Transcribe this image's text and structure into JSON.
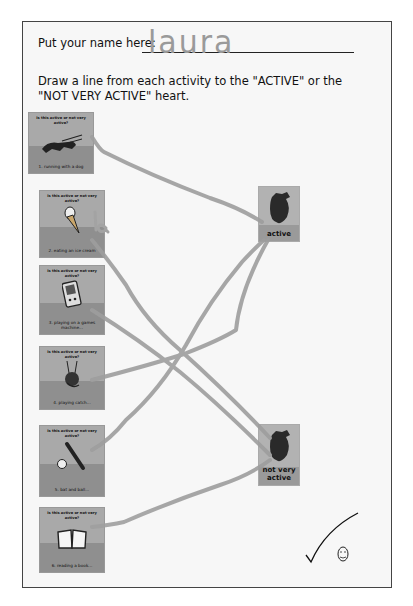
{
  "worksheet": {
    "name_prompt": "Put your name here:",
    "name_value": "laura",
    "instruction": "Draw a line from each activity to the \"ACTIVE\" or the \"NOT VERY ACTIVE\" heart."
  },
  "activities": [
    {
      "question": "Is this active or not very active?",
      "caption": "1. running with a dog",
      "icon": "dog-running-icon",
      "answer": "active"
    },
    {
      "question": "Is this active or not very active?",
      "caption": "2. eating an ice cream",
      "icon": "ice-cream-icon",
      "answer": "not very active"
    },
    {
      "question": "Is this active or not very active?",
      "caption": "3. playing on a games machine...",
      "icon": "game-console-icon",
      "answer": "not very active"
    },
    {
      "question": "Is this active or not very active?",
      "caption": "4. playing catch...",
      "icon": "ball-catch-icon",
      "answer": "active"
    },
    {
      "question": "Is this active or not very active?",
      "caption": "5. bat and ball...",
      "icon": "bat-and-ball-icon",
      "answer": "active"
    },
    {
      "question": "Is this active or not very active?",
      "caption": "6. reading a book...",
      "icon": "book-icon",
      "answer": "not very active"
    }
  ],
  "targets": {
    "active": {
      "label": "active"
    },
    "not_very_active": {
      "label": "not very active"
    }
  },
  "annotations": {
    "stray_mark": "la",
    "teacher_mark": "checkmark",
    "smiley": "smiley-face"
  },
  "colors": {
    "pencil_line": "#9e9e9e",
    "card_top": "#a9a9a9",
    "card_bottom": "#8f8f8f",
    "border": "#444444"
  }
}
